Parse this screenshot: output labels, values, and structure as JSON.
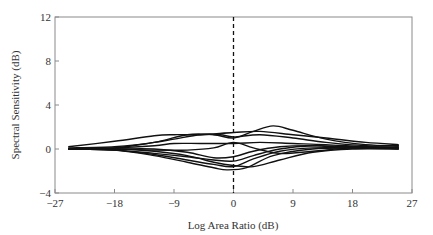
{
  "chart_data": {
    "type": "line",
    "title": "",
    "xlabel": "Log Area Ratio (dB)",
    "ylabel": "Spectral Sensitivity (dB)",
    "xlim": [
      -27,
      27
    ],
    "ylim": [
      -4,
      12
    ],
    "xticks": [
      -27,
      -18,
      -9,
      0,
      9,
      18,
      27
    ],
    "yticks": [
      -4,
      0,
      4,
      8,
      12
    ],
    "xtick_labels": [
      "−27",
      "−18",
      "−9",
      "0",
      "9",
      "18",
      "27"
    ],
    "ytick_labels": [
      "−4",
      "0",
      "4",
      "8",
      "12"
    ],
    "grid": false,
    "legend": "none",
    "reference_line": {
      "axis": "x",
      "value": 0,
      "style": "dashed"
    },
    "series": [
      {
        "name": "curve-1",
        "x": [
          -25,
          -18,
          -12,
          -9,
          -5,
          0,
          4,
          9,
          14,
          20,
          25
        ],
        "y": [
          0.2,
          0.7,
          1.2,
          1.3,
          1.3,
          1.5,
          1.6,
          1.3,
          1.0,
          0.6,
          0.4
        ]
      },
      {
        "name": "curve-2",
        "x": [
          -25,
          -18,
          -12,
          -7,
          -3,
          0,
          3,
          6,
          9,
          14,
          20,
          25
        ],
        "y": [
          0.1,
          0.2,
          0.6,
          1.3,
          1.3,
          1.0,
          1.6,
          2.1,
          1.7,
          0.9,
          0.4,
          0.3
        ]
      },
      {
        "name": "curve-3",
        "x": [
          -25,
          -18,
          -12,
          -9,
          -5,
          -2,
          0,
          4,
          9,
          14,
          20,
          25
        ],
        "y": [
          0.0,
          0.1,
          0.6,
          0.9,
          1.3,
          1.3,
          1.1,
          1.3,
          1.0,
          0.6,
          0.3,
          0.3
        ]
      },
      {
        "name": "curve-4",
        "x": [
          -25,
          -18,
          -12,
          -9,
          -5,
          0,
          4,
          9,
          14,
          20,
          25
        ],
        "y": [
          0.0,
          0.1,
          0.3,
          0.5,
          0.5,
          0.5,
          0.6,
          0.5,
          0.4,
          0.2,
          0.2
        ]
      },
      {
        "name": "curve-5",
        "x": [
          -25,
          -18,
          -12,
          -7,
          -3,
          0,
          3,
          7,
          12,
          18,
          25
        ],
        "y": [
          0.0,
          0.0,
          -0.1,
          -0.1,
          0.1,
          0.6,
          0.1,
          -0.4,
          -0.2,
          0.1,
          0.1
        ]
      },
      {
        "name": "curve-6",
        "x": [
          -25,
          -18,
          -12,
          -7,
          -3,
          0,
          3,
          7,
          12,
          18,
          25
        ],
        "y": [
          0.0,
          -0.1,
          -0.4,
          -0.7,
          -1.0,
          -1.1,
          -0.6,
          0.0,
          0.3,
          0.2,
          0.1
        ]
      },
      {
        "name": "curve-7",
        "x": [
          -25,
          -18,
          -12,
          -7,
          -3,
          0,
          3,
          7,
          12,
          18,
          25
        ],
        "y": [
          0.0,
          -0.1,
          -0.5,
          -1.0,
          -1.4,
          -1.6,
          -0.9,
          -0.2,
          0.1,
          0.1,
          0.1
        ]
      },
      {
        "name": "curve-8",
        "x": [
          -25,
          -18,
          -12,
          -7,
          -3,
          -1,
          2,
          6,
          12,
          18,
          25
        ],
        "y": [
          0.0,
          -0.1,
          -0.6,
          -1.2,
          -1.7,
          -1.9,
          -1.7,
          -0.6,
          0.0,
          0.1,
          0.1
        ]
      },
      {
        "name": "curve-9",
        "x": [
          -25,
          -18,
          -12,
          -7,
          -3,
          0,
          3,
          7,
          12,
          18,
          25
        ],
        "y": [
          0.0,
          0.0,
          -0.2,
          -0.6,
          -1.2,
          -1.5,
          -1.6,
          -1.0,
          -0.3,
          0.0,
          0.0
        ]
      },
      {
        "name": "curve-10",
        "x": [
          -25,
          -18,
          -12,
          -7,
          -3,
          0,
          3,
          7,
          12,
          18,
          25
        ],
        "y": [
          0.0,
          0.0,
          0.0,
          -0.3,
          -0.8,
          -0.7,
          -0.2,
          0.2,
          0.3,
          0.1,
          0.0
        ]
      }
    ]
  }
}
